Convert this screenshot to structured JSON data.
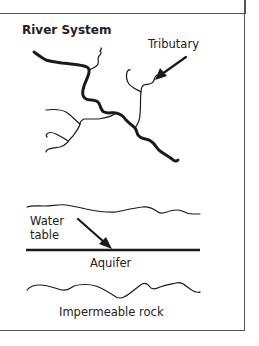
{
  "diagram": {
    "title": "River System",
    "labels": {
      "tributary": "Tributary",
      "water_table_line1": "Water",
      "water_table_line2": "table",
      "aquifer": "Aquifer",
      "impermeable_rock": "Impermeable rock"
    },
    "colors": {
      "line": "#1a1a1a",
      "border": "#555555",
      "background": "#ffffff"
    }
  }
}
